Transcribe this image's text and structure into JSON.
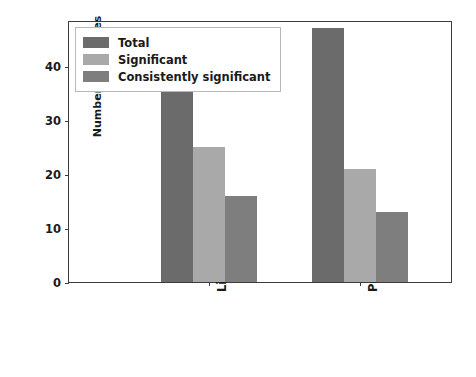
{
  "chart_data": {
    "type": "bar",
    "title": "",
    "xlabel": "",
    "ylabel": "Number of features",
    "categories": [
      "Literature",
      "Proposed"
    ],
    "series": [
      {
        "name": "Total",
        "values": [
          36,
          47
        ],
        "color": "#6b6b6b"
      },
      {
        "name": "Significant",
        "values": [
          25,
          21
        ],
        "color": "#a9a9a9"
      },
      {
        "name": "Consistently significant",
        "values": [
          16,
          13
        ],
        "color": "#7e7e7e"
      }
    ],
    "ylim": [
      0,
      48.5
    ],
    "yticks": [
      0,
      10,
      20,
      30,
      40
    ],
    "ytick_labels": [
      "0",
      "10",
      "20",
      "30",
      "40"
    ],
    "grid": false,
    "legend_position": "upper left",
    "xtick_rotation": 90
  },
  "axes": {
    "y_label": "Number of features",
    "y_ticks": [
      "0",
      "10",
      "20",
      "30",
      "40"
    ],
    "x_ticks": [
      "Literature",
      "Proposed"
    ]
  },
  "legend": {
    "entries": [
      {
        "label": "Total",
        "color": "#6b6b6b"
      },
      {
        "label": "Significant",
        "color": "#a9a9a9"
      },
      {
        "label": "Consistently significant",
        "color": "#7e7e7e"
      }
    ]
  },
  "style": {
    "background": "#ffffff",
    "axis_color": "#3c3c3c",
    "text_color": "#1a1a1a",
    "legend_border": "#b8b8b8"
  }
}
